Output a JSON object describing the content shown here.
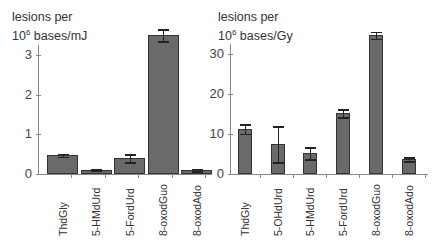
{
  "chart_data": [
    {
      "type": "bar",
      "ylabel_line1": "lesions per",
      "ylabel_line2_base": "10",
      "ylabel_line2_exp": "6",
      "ylabel_line2_rest": " bases/mJ",
      "ylim": [
        0,
        3.5
      ],
      "yticks": [
        0,
        1,
        2,
        3
      ],
      "categories": [
        "ThdGly",
        "5-HMdUrd",
        "5-FordUrd",
        "8-oxodGuo",
        "8-oxodAdo"
      ],
      "values": [
        0.47,
        0.1,
        0.4,
        3.5,
        0.1
      ],
      "errors": [
        0.04,
        0.02,
        0.1,
        0.15,
        0.03
      ],
      "bar_color": "#6a6a6a"
    },
    {
      "type": "bar",
      "ylabel_line1": "lesions per",
      "ylabel_line2_base": "10",
      "ylabel_line2_exp": "6",
      "ylabel_line2_rest": " bases/Gy",
      "ylim": [
        0,
        35
      ],
      "yticks": [
        0,
        10,
        20,
        30
      ],
      "categories": [
        "ThdGly",
        "5-OHdUrd",
        "5-HMdUrd",
        "5-FordUrd",
        "8-oxodGuo",
        "8-oxodAdo"
      ],
      "values": [
        11.3,
        7.5,
        5.2,
        15.2,
        34.7,
        3.7
      ],
      "errors": [
        1.2,
        4.5,
        1.5,
        1.0,
        0.9,
        0.5
      ],
      "bar_color": "#6a6a6a"
    }
  ]
}
